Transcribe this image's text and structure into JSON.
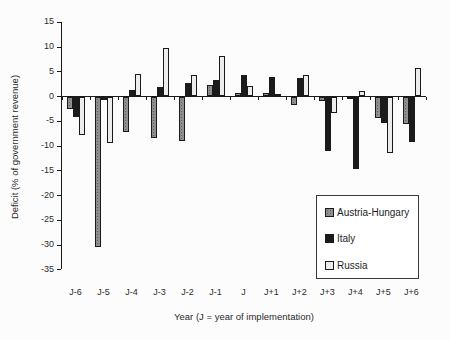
{
  "chart_data": {
    "type": "bar",
    "title": "",
    "xlabel": "Year (J = year of implementation)",
    "ylabel": "Deficit (% of government revenue)",
    "ylim": [
      -35,
      15
    ],
    "yticks": [
      15,
      10,
      5,
      0,
      -5,
      -10,
      -15,
      -20,
      -25,
      -30,
      -35
    ],
    "categories": [
      "J-6",
      "J-5",
      "J-4",
      "J-3",
      "J-2",
      "J-1",
      "J",
      "J+1",
      "J+2",
      "J+3",
      "J+4",
      "J+5",
      "J+6"
    ],
    "series": [
      {
        "name": "Austria-Hungary",
        "color": "#8f8f8f",
        "values": [
          -2.4,
          -30.3,
          -7.0,
          -8.2,
          -8.9,
          2.3,
          0.7,
          0.7,
          -1.6,
          -0.9,
          -0.5,
          -4.2,
          -5.5
        ]
      },
      {
        "name": "Italy",
        "color": "#1b1b1b",
        "values": [
          -4.1,
          -0.7,
          1.3,
          1.8,
          2.6,
          3.3,
          4.3,
          3.8,
          3.6,
          -11.0,
          -14.5,
          -5.3,
          -9.0
        ]
      },
      {
        "name": "Russia",
        "color": "#ececec",
        "values": [
          -7.6,
          -9.3,
          4.5,
          9.7,
          4.3,
          8.0,
          2.1,
          0.4,
          4.3,
          -3.3,
          1.0,
          -11.4,
          5.7
        ]
      }
    ],
    "legend_position": "inside-bottom-right",
    "grid": false,
    "axis_color": "#1a1a1a",
    "bar_border_color": "#1a1a1a",
    "text_color": "#2b2b2b"
  }
}
